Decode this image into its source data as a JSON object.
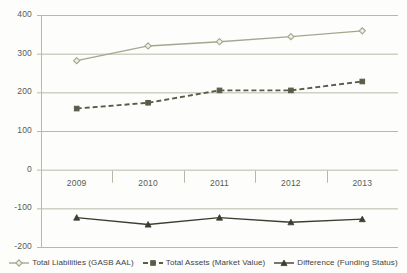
{
  "chart_data": {
    "type": "line",
    "title": "",
    "xlabel": "",
    "ylabel": "",
    "categories": [
      "2009",
      "2010",
      "2011",
      "2012",
      "2013"
    ],
    "ylim": [
      -200,
      400
    ],
    "yticks": [
      400,
      300,
      200,
      100,
      0,
      -100,
      -200
    ],
    "ytick_labels": [
      "400",
      "300",
      "200",
      "100",
      "0",
      "-100",
      "-200"
    ],
    "grid": true,
    "legend_position": "bottom",
    "series": [
      {
        "name": "Total Liabilities (GASB AAL)",
        "values": [
          282,
          320,
          331,
          344,
          359
        ],
        "color": "#a6a68f",
        "marker": "diamond",
        "line_style": "solid"
      },
      {
        "name": "Total Assets (Market Value)",
        "values": [
          158,
          173,
          205,
          205,
          228
        ],
        "color": "#5b5b4a",
        "marker": "square",
        "line_style": "dashed"
      },
      {
        "name": "Difference (Funding Status)",
        "values": [
          -124,
          -142,
          -124,
          -136,
          -128
        ],
        "color": "#3c3c30",
        "marker": "triangle",
        "line_style": "solid"
      }
    ]
  },
  "axis": {
    "gridline_color": "#b8b8a8",
    "axis_line_color": "#b8b8a8",
    "background": "#fdfdfb"
  }
}
